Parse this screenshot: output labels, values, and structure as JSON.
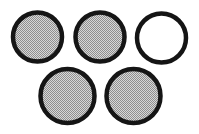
{
  "figure": {
    "canvas": {
      "width": 199,
      "height": 134,
      "background_color": "#ffffff"
    },
    "style": {
      "stroke_color": "#151515",
      "stroke_width": 4.5,
      "filled_color": "#b4b4b4",
      "unfilled_color": "#ffffff",
      "fill_pattern": "dithered-gray-halftone",
      "dither_dark": "#5a5a5a",
      "dither_light": "#dcdcdc"
    },
    "shape_count": 5,
    "filled_count": 4,
    "unfilled_count": 1,
    "rows": [
      {
        "row_label": "top-row",
        "shape_count": 3
      },
      {
        "row_label": "bottom-row",
        "shape_count": 2
      }
    ],
    "shapes": [
      {
        "id": "circle-1",
        "label": "Circle 1",
        "row": "top-row",
        "position": "top-left",
        "cx": 37.5,
        "cy": 37.0,
        "r": 24.5,
        "filled": true,
        "fill": "#b4b4b4"
      },
      {
        "id": "circle-2",
        "label": "Circle 2",
        "row": "top-row",
        "position": "top-center",
        "cx": 100.0,
        "cy": 37.0,
        "r": 24.5,
        "filled": true,
        "fill": "#b4b4b4"
      },
      {
        "id": "circle-3",
        "label": "Circle 3",
        "row": "top-row",
        "position": "top-right",
        "cx": 161.5,
        "cy": 38.0,
        "r": 24.5,
        "filled": false,
        "fill": "#ffffff"
      },
      {
        "id": "circle-4",
        "label": "Circle 4",
        "row": "bottom-row",
        "position": "bottom-left",
        "cx": 67.5,
        "cy": 96.0,
        "r": 27.0,
        "filled": true,
        "fill": "#b4b4b4"
      },
      {
        "id": "circle-5",
        "label": "Circle 5",
        "row": "bottom-row",
        "position": "bottom-right",
        "cx": 133.5,
        "cy": 96.0,
        "r": 27.0,
        "filled": true,
        "fill": "#b4b4b4"
      }
    ]
  }
}
